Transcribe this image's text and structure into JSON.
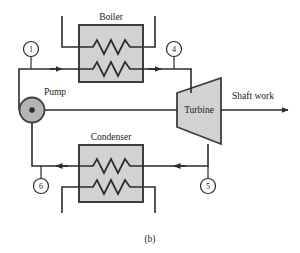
{
  "figure": {
    "caption": "(b)",
    "type": "rankine-cycle-schematic"
  },
  "components": {
    "boiler": {
      "label": "Boiler",
      "fill": "#d2d2d2",
      "stroke": "#3d3d3d"
    },
    "condenser": {
      "label": "Condenser",
      "fill": "#d2d2d2",
      "stroke": "#3d3d3d"
    },
    "turbine": {
      "label": "Turbine",
      "fill": "#d2d2d2",
      "stroke": "#3d3d3d"
    },
    "pump": {
      "label": "Pump",
      "fill": "#b4b4b4",
      "stroke": "#3d3d3d"
    }
  },
  "outputs": {
    "shaft_work": "Shaft work"
  },
  "state_points": [
    {
      "id": "1",
      "label": "1"
    },
    {
      "id": "4",
      "label": "4"
    },
    {
      "id": "5",
      "label": "5"
    },
    {
      "id": "6",
      "label": "6"
    }
  ],
  "colors": {
    "line": "#2b2b2b",
    "component_fill": "#d2d2d2",
    "component_stroke": "#3d3d3d",
    "pump_fill": "#b4b4b4",
    "background": "#ffffff",
    "text": "#1a1a1a"
  }
}
